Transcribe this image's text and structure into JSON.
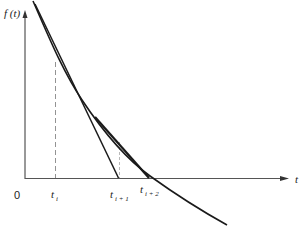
{
  "diagram": {
    "y_axis_label": "f (t)",
    "x_axis_label": "t",
    "origin_label": "0",
    "ticks": [
      {
        "base": "t",
        "sub": "i"
      },
      {
        "base": "t",
        "sub": "i + 1"
      },
      {
        "base": "t",
        "sub": "i + 2"
      }
    ],
    "elements": {
      "curve": "decreasing convex function f(t) crossing the t-axis to the right of t_i+2",
      "tangent_1": "tangent at t_i, intersects t-axis at t_i+1",
      "tangent_2": "tangent at t_i+1, intersects t-axis at t_i+2",
      "dashed_guides": [
        "vertical from t_i to curve",
        "vertical from t_i+1 to curve"
      ]
    },
    "colors": {
      "stroke": "#1a1a1a",
      "guide": "#777777",
      "background": "#ffffff"
    }
  }
}
